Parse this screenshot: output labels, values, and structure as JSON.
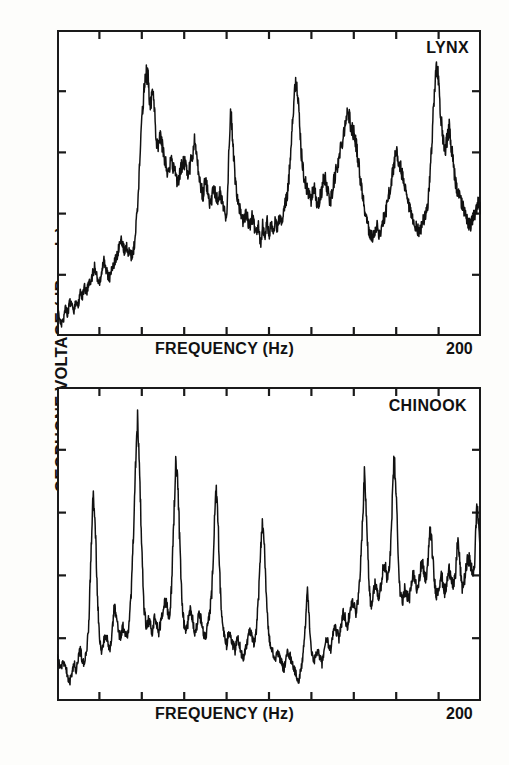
{
  "figure": {
    "y_axis_title": "GEOPHONE VOLTAGE (dB scale)",
    "background_color": "#fdfdfb",
    "line_color": "#111111"
  },
  "panels": [
    {
      "name": "LYNX",
      "label": "LYNX",
      "x_axis_title": "FREQUENCY   (Hz)",
      "x_max_label": "200"
    },
    {
      "name": "CHINOOK",
      "label": "CHINOOK",
      "x_axis_title": "FREQUENCY   (Hz)",
      "x_max_label": "200"
    }
  ],
  "chart_data": [
    {
      "type": "line",
      "title": "LYNX",
      "xlabel": "FREQUENCY   (Hz)",
      "ylabel": "GEOPHONE VOLTAGE (dB scale)",
      "xlim": [
        0,
        200
      ],
      "ylim": [
        0,
        100
      ],
      "x_ticks": [
        0,
        20,
        40,
        60,
        80,
        100,
        120,
        140,
        160,
        180,
        200
      ],
      "x_tick_labels": [
        "",
        "",
        "",
        "",
        "",
        "",
        "",
        "",
        "",
        "",
        "200"
      ],
      "y_ticks": [
        0,
        20,
        40,
        60,
        80,
        100
      ],
      "y_tick_labels": [
        "",
        "",
        "",
        "",
        "",
        ""
      ],
      "grid": false,
      "legend": false,
      "series": [
        {
          "name": "LYNX spectrum",
          "x": [
            0,
            1,
            2,
            3,
            4,
            5,
            6,
            7,
            8,
            9,
            10,
            11,
            12,
            13,
            14,
            15,
            16,
            17,
            18,
            19,
            20,
            21,
            22,
            23,
            24,
            25,
            26,
            27,
            28,
            29,
            30,
            31,
            32,
            33,
            34,
            35,
            36,
            37,
            38,
            39,
            40,
            41,
            42,
            43,
            44,
            45,
            46,
            47,
            48,
            49,
            50,
            51,
            52,
            53,
            54,
            55,
            56,
            57,
            58,
            59,
            60,
            61,
            62,
            63,
            64,
            65,
            66,
            67,
            68,
            69,
            70,
            71,
            72,
            73,
            74,
            75,
            76,
            77,
            78,
            79,
            80,
            81,
            82,
            83,
            84,
            85,
            86,
            87,
            88,
            89,
            90,
            91,
            92,
            93,
            94,
            95,
            96,
            97,
            98,
            99,
            100,
            101,
            102,
            103,
            104,
            105,
            106,
            107,
            108,
            109,
            110,
            111,
            112,
            113,
            114,
            115,
            116,
            117,
            118,
            119,
            120,
            121,
            122,
            123,
            124,
            125,
            126,
            127,
            128,
            129,
            130,
            131,
            132,
            133,
            134,
            135,
            136,
            137,
            138,
            139,
            140,
            141,
            142,
            143,
            144,
            145,
            146,
            147,
            148,
            149,
            150,
            151,
            152,
            153,
            154,
            155,
            156,
            157,
            158,
            159,
            160,
            161,
            162,
            163,
            164,
            165,
            166,
            167,
            168,
            169,
            170,
            171,
            172,
            173,
            174,
            175,
            176,
            177,
            178,
            179,
            180,
            181,
            182,
            183,
            184,
            185,
            186,
            187,
            188,
            189,
            190,
            191,
            192,
            193,
            194,
            195,
            196,
            197,
            198,
            199,
            200
          ],
          "y": [
            10,
            6,
            4,
            5,
            9,
            7,
            11,
            10,
            8,
            12,
            10,
            14,
            13,
            16,
            14,
            18,
            17,
            21,
            23,
            19,
            17,
            20,
            25,
            22,
            20,
            19,
            22,
            24,
            26,
            28,
            31,
            30,
            27,
            29,
            27,
            26,
            28,
            33,
            43,
            56,
            70,
            80,
            86,
            84,
            74,
            80,
            73,
            64,
            62,
            66,
            60,
            57,
            54,
            56,
            58,
            55,
            52,
            50,
            53,
            56,
            57,
            55,
            53,
            56,
            59,
            65,
            59,
            52,
            48,
            46,
            52,
            47,
            43,
            45,
            49,
            46,
            44,
            47,
            43,
            41,
            39,
            58,
            74,
            62,
            52,
            46,
            42,
            39,
            37,
            40,
            38,
            36,
            39,
            36,
            34,
            37,
            30,
            36,
            32,
            38,
            33,
            36,
            34,
            38,
            35,
            39,
            36,
            41,
            44,
            48,
            58,
            70,
            79,
            84,
            74,
            62,
            55,
            50,
            48,
            46,
            44,
            49,
            46,
            42,
            45,
            48,
            52,
            50,
            46,
            44,
            48,
            52,
            55,
            58,
            62,
            66,
            70,
            73,
            71,
            68,
            66,
            63,
            58,
            52,
            47,
            42,
            38,
            35,
            33,
            32,
            34,
            36,
            33,
            35,
            38,
            40,
            44,
            48,
            52,
            56,
            60,
            58,
            55,
            52,
            48,
            45,
            42,
            40,
            37,
            36,
            35,
            34,
            36,
            38,
            40,
            44,
            52,
            66,
            80,
            88,
            84,
            72,
            64,
            60,
            64,
            68,
            62,
            56,
            50,
            47,
            45,
            43,
            41,
            39,
            37,
            36,
            38,
            40,
            42,
            44,
            40,
            38,
            36,
            38,
            42,
            46,
            52,
            58,
            64,
            68,
            66,
            62,
            58,
            54,
            50,
            47,
            44,
            42,
            40,
            38,
            40,
            42,
            40,
            38,
            36,
            38,
            40,
            42,
            44,
            46,
            50,
            54,
            58,
            56,
            52,
            50,
            47,
            45,
            43,
            41,
            40,
            42,
            44,
            42,
            40,
            42,
            44,
            46,
            48,
            52,
            56,
            60,
            58,
            54,
            50,
            47,
            46,
            44,
            42,
            40,
            42,
            44,
            46,
            44,
            42,
            44,
            46,
            48,
            50,
            52,
            56,
            60,
            64
          ]
        }
      ]
    },
    {
      "type": "line",
      "title": "CHINOOK",
      "xlabel": "FREQUENCY   (Hz)",
      "ylabel": "GEOPHONE VOLTAGE (dB scale)",
      "xlim": [
        0,
        200
      ],
      "ylim": [
        0,
        100
      ],
      "x_ticks": [
        0,
        20,
        40,
        60,
        80,
        100,
        120,
        140,
        160,
        180,
        200
      ],
      "x_tick_labels": [
        "",
        "",
        "",
        "",
        "",
        "",
        "",
        "",
        "",
        "",
        "200"
      ],
      "y_ticks": [
        0,
        20,
        40,
        60,
        80,
        100
      ],
      "y_tick_labels": [
        "",
        "",
        "",
        "",
        "",
        ""
      ],
      "grid": false,
      "legend": false,
      "series": [
        {
          "name": "CHINOOK spectrum",
          "x": [
            0,
            1,
            2,
            3,
            4,
            5,
            6,
            7,
            8,
            9,
            10,
            11,
            12,
            13,
            14,
            15,
            16,
            17,
            18,
            19,
            20,
            21,
            22,
            23,
            24,
            25,
            26,
            27,
            28,
            29,
            30,
            31,
            32,
            33,
            34,
            35,
            36,
            37,
            38,
            39,
            40,
            41,
            42,
            43,
            44,
            45,
            46,
            47,
            48,
            49,
            50,
            51,
            52,
            53,
            54,
            55,
            56,
            57,
            58,
            59,
            60,
            61,
            62,
            63,
            64,
            65,
            66,
            67,
            68,
            69,
            70,
            71,
            72,
            73,
            74,
            75,
            76,
            77,
            78,
            79,
            80,
            81,
            82,
            83,
            84,
            85,
            86,
            87,
            88,
            89,
            90,
            91,
            92,
            93,
            94,
            95,
            96,
            97,
            98,
            99,
            100,
            101,
            102,
            103,
            104,
            105,
            106,
            107,
            108,
            109,
            110,
            111,
            112,
            113,
            114,
            115,
            116,
            117,
            118,
            119,
            120,
            121,
            122,
            123,
            124,
            125,
            126,
            127,
            128,
            129,
            130,
            131,
            132,
            133,
            134,
            135,
            136,
            137,
            138,
            139,
            140,
            141,
            142,
            143,
            144,
            145,
            146,
            147,
            148,
            149,
            150,
            151,
            152,
            153,
            154,
            155,
            156,
            157,
            158,
            159,
            160,
            161,
            162,
            163,
            164,
            165,
            166,
            167,
            168,
            169,
            170,
            171,
            172,
            173,
            174,
            175,
            176,
            177,
            178,
            179,
            180,
            181,
            182,
            183,
            184,
            185,
            186,
            187,
            188,
            189,
            190,
            191,
            192,
            193,
            194,
            195,
            196,
            197,
            198,
            199,
            200
          ],
          "y": [
            14,
            12,
            10,
            13,
            11,
            8,
            6,
            9,
            12,
            10,
            14,
            16,
            13,
            12,
            16,
            24,
            46,
            66,
            58,
            34,
            20,
            16,
            19,
            22,
            19,
            16,
            22,
            30,
            27,
            22,
            20,
            24,
            22,
            20,
            24,
            34,
            52,
            74,
            90,
            72,
            48,
            30,
            24,
            26,
            24,
            22,
            26,
            24,
            22,
            25,
            28,
            32,
            30,
            26,
            36,
            56,
            76,
            70,
            48,
            30,
            24,
            22,
            26,
            30,
            26,
            22,
            24,
            28,
            26,
            22,
            20,
            24,
            28,
            34,
            52,
            68,
            56,
            36,
            24,
            20,
            18,
            22,
            20,
            18,
            16,
            20,
            18,
            15,
            14,
            17,
            20,
            22,
            20,
            18,
            22,
            32,
            48,
            58,
            46,
            30,
            20,
            17,
            15,
            13,
            16,
            14,
            12,
            10,
            13,
            16,
            14,
            12,
            10,
            8,
            6,
            10,
            14,
            22,
            36,
            26,
            16,
            12,
            14,
            16,
            14,
            12,
            16,
            20,
            18,
            16,
            20,
            24,
            22,
            20,
            24,
            28,
            26,
            24,
            28,
            32,
            30,
            28,
            32,
            40,
            56,
            72,
            60,
            40,
            30,
            34,
            38,
            36,
            32,
            38,
            44,
            42,
            38,
            44,
            60,
            78,
            66,
            44,
            34,
            32,
            36,
            34,
            32,
            36,
            40,
            38,
            36,
            40,
            44,
            42,
            38,
            44,
            56,
            48,
            38,
            34,
            36,
            40,
            38,
            34,
            38,
            42,
            40,
            36,
            40,
            52,
            44,
            36,
            38,
            42,
            46,
            44,
            40,
            44,
            62,
            56,
            42,
            38,
            40,
            44,
            48,
            52,
            58,
            50,
            44,
            48,
            52,
            56
          ]
        }
      ]
    }
  ]
}
